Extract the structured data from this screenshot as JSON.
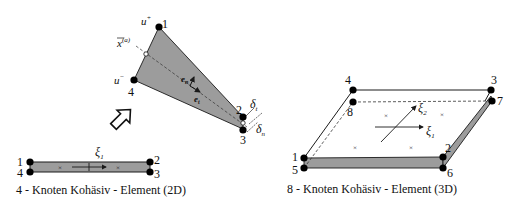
{
  "colors": {
    "fill": "#9c9c9c",
    "stroke": "#1a1a1a",
    "node": "#000000",
    "background": "#ffffff"
  },
  "element_2d": {
    "caption": "4 - Knoten Kohäsiv - Element (2D)",
    "nodes": [
      "1",
      "2",
      "3",
      "4"
    ],
    "axis_label": "ξ",
    "axis_sub": "1"
  },
  "deformed_2d": {
    "nodes": [
      "1",
      "2",
      "3",
      "4"
    ],
    "u_plus": "u",
    "u_plus_sup": "+",
    "u_minus": "u",
    "u_minus_sup": "−",
    "mid_point": "x",
    "mid_point_sup": "(a)",
    "e_n": "e",
    "e_n_sub": "n",
    "e_t": "e",
    "e_t_sub": "t",
    "delta_t": "δ",
    "delta_t_sub": "t",
    "delta_n": "δ",
    "delta_n_sub": "n"
  },
  "element_3d": {
    "caption": "8 - Knoten Kohäsiv - Element (3D)",
    "nodes": [
      "1",
      "2",
      "3",
      "4",
      "5",
      "6",
      "7",
      "8"
    ],
    "axis1_label": "ξ",
    "axis1_sub": "1",
    "axis2_label": "ξ",
    "axis2_sub": "2"
  },
  "transform_arrow": "open-arrow-icon"
}
